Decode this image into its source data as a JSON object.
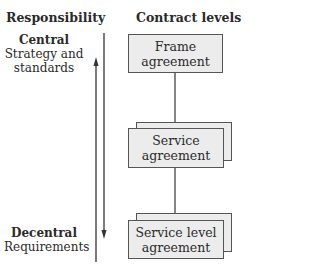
{
  "headers": {
    "responsibility": "Responsibility",
    "contract_levels": "Contract levels"
  },
  "responsibility_levels": [
    {
      "title": "Central",
      "subtitle_line1": "Strategy and",
      "subtitle_line2": "standards"
    },
    {
      "title": "Decentral",
      "subtitle_line1": "Requirements"
    }
  ],
  "contract_boxes": [
    {
      "line1": "Frame",
      "line2": "agreement",
      "stacked": false
    },
    {
      "line1": "Service",
      "line2": "agreement",
      "stacked": true
    },
    {
      "line1": "Service level",
      "line2": "agreement",
      "stacked": true
    }
  ],
  "arrows": [
    {
      "direction": "up",
      "meaning": "responsibility toward central"
    },
    {
      "direction": "down",
      "meaning": "responsibility toward decentral"
    }
  ],
  "colors": {
    "box_fill": "#ececec",
    "box_border": "#555555",
    "line": "#333333"
  }
}
